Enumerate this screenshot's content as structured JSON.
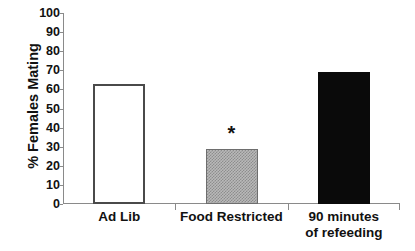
{
  "chart_data": {
    "type": "bar",
    "title": "",
    "xlabel": "",
    "ylabel": "% Females Mating",
    "ylim": [
      0,
      100
    ],
    "yticks": [
      0,
      10,
      20,
      30,
      40,
      50,
      60,
      70,
      80,
      90,
      100
    ],
    "ytick_labels": [
      "0",
      "10",
      "20",
      "30",
      "40",
      "50",
      "60",
      "70",
      "80",
      "90",
      "100"
    ],
    "grid": false,
    "legend": "none",
    "categories": [
      "Ad Lib",
      "Food Restricted",
      "90 minutes of refeeding"
    ],
    "category_lines": [
      [
        "Ad Lib"
      ],
      [
        "Food Restricted"
      ],
      [
        "90 minutes",
        "of refeeding"
      ]
    ],
    "values": [
      63,
      29,
      69
    ],
    "bars": [
      {
        "category": "Ad Lib",
        "value": 63,
        "fill": "white",
        "edge_color": "#4a4a4a",
        "annotation": ""
      },
      {
        "category": "Food Restricted",
        "value": 29,
        "fill": "hatched-gray",
        "edge_color": "#6e6e6e",
        "annotation": "*"
      },
      {
        "category": "90 minutes of refeeding",
        "value": 69,
        "fill": "black",
        "edge_color": "#0a0a0a",
        "annotation": ""
      }
    ],
    "annotations": [
      {
        "text": "*",
        "category": "Food Restricted",
        "meaning": "significance marker"
      }
    ],
    "colors": {
      "axis": "#8a8a8a",
      "text": "#111111",
      "bar_open_edge": "#4a4a4a",
      "bar_hatched": "#b9b9b9",
      "bar_solid": "#0a0a0a",
      "background": "#ffffff"
    }
  }
}
